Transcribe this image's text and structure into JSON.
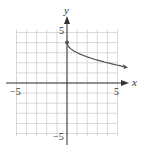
{
  "chart_data": {
    "type": "line",
    "title": "",
    "xlabel": "x",
    "ylabel": "y",
    "xlim": [
      -5,
      5
    ],
    "ylim": [
      -5,
      5
    ],
    "grid": true,
    "x_ticks_labeled": [
      -5,
      5
    ],
    "y_ticks_labeled": [
      5,
      -5
    ],
    "tick_labels": {
      "x_neg": "−5",
      "x_pos": "5",
      "y_pos": "5",
      "y_neg": "−5"
    },
    "series": [
      {
        "name": "y = 4 − √x",
        "start_point": {
          "x": 0,
          "y": 4,
          "closed_dot": true
        },
        "end_arrow": true,
        "x": [
          0,
          0.25,
          1,
          2,
          3,
          4,
          5,
          6
        ],
        "y": [
          4,
          3.5,
          3,
          2.59,
          2.27,
          2,
          1.76,
          1.55
        ]
      }
    ]
  },
  "colors": {
    "grid": "#c8c8c8",
    "axis": "#333333",
    "curve": "#555555"
  }
}
